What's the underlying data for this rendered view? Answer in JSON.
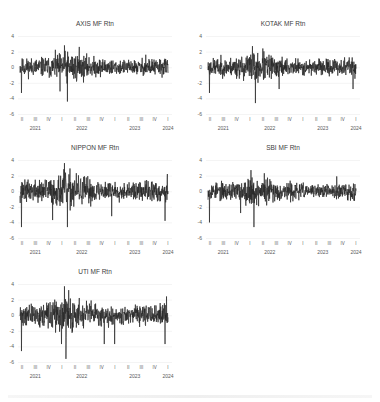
{
  "figure": {
    "panels": [
      {
        "id": "axis",
        "title": "AXIS MF Rtn",
        "left": 0,
        "top": 20
      },
      {
        "id": "kotak",
        "title": "KOTAK MF Rtn",
        "left": 188,
        "top": 20
      },
      {
        "id": "nippon",
        "title": "NIPPON MF Rtn",
        "left": 0,
        "top": 144
      },
      {
        "id": "sbi",
        "title": "SBI MF Rtn",
        "left": 188,
        "top": 144
      },
      {
        "id": "uti",
        "title": "UTI MF Rtn",
        "left": 0,
        "top": 268
      }
    ],
    "y_ticks": [
      "4",
      "2",
      "0",
      "-2",
      "-4",
      "-6"
    ],
    "quarter_ticks": [
      "II",
      "III",
      "IV",
      "I",
      "II",
      "III",
      "IV",
      "I",
      "II",
      "III",
      "IV",
      "I"
    ],
    "year_ticks": [
      {
        "label": "2021",
        "q": 1
      },
      {
        "label": "2022",
        "q": 4.5
      },
      {
        "label": "2023",
        "q": 8.5
      },
      {
        "label": "2024",
        "q": 11
      }
    ],
    "line_color": "#262626",
    "grid_color": "#ececec"
  },
  "chart_data": [
    {
      "type": "line",
      "title": "AXIS MF Rtn",
      "xlabel": "",
      "ylabel": "",
      "ylim": [
        -6,
        4
      ],
      "x_range": [
        "2021-Q2",
        "2024-Q1"
      ],
      "grid": true,
      "series": [
        {
          "name": "AXIS MF Rtn",
          "seed": 11,
          "volatility": 0.8,
          "spikes": [
            {
              "pos": 0.01,
              "value": -3.3
            },
            {
              "pos": 0.3,
              "value": 2.8
            },
            {
              "pos": 0.32,
              "value": -4.4
            },
            {
              "pos": 0.27,
              "value": -3.1
            },
            {
              "pos": 0.4,
              "value": 2.6
            },
            {
              "pos": 0.85,
              "value": 1.6
            }
          ]
        }
      ]
    },
    {
      "type": "line",
      "title": "KOTAK MF Rtn",
      "xlabel": "",
      "ylabel": "",
      "ylim": [
        -6,
        4
      ],
      "x_range": [
        "2021-Q2",
        "2024-Q1"
      ],
      "grid": true,
      "series": [
        {
          "name": "KOTAK MF Rtn",
          "seed": 23,
          "volatility": 0.8,
          "spikes": [
            {
              "pos": 0.01,
              "value": -3.3
            },
            {
              "pos": 0.3,
              "value": 2.7
            },
            {
              "pos": 0.32,
              "value": -4.6
            },
            {
              "pos": 0.37,
              "value": 2.4
            },
            {
              "pos": 0.48,
              "value": -2.8
            },
            {
              "pos": 0.98,
              "value": -2.8
            }
          ]
        }
      ]
    },
    {
      "type": "line",
      "title": "NIPPON MF Rtn",
      "xlabel": "",
      "ylabel": "",
      "ylim": [
        -6,
        4
      ],
      "x_range": [
        "2021-Q2",
        "2024-Q1"
      ],
      "grid": true,
      "series": [
        {
          "name": "NIPPON MF Rtn",
          "seed": 37,
          "volatility": 0.95,
          "spikes": [
            {
              "pos": 0.01,
              "value": -4.6
            },
            {
              "pos": 0.22,
              "value": -3.7
            },
            {
              "pos": 0.3,
              "value": 3.6
            },
            {
              "pos": 0.32,
              "value": -4.6
            },
            {
              "pos": 0.62,
              "value": -3.2
            },
            {
              "pos": 0.98,
              "value": -3.8
            },
            {
              "pos": 0.995,
              "value": 2.2
            }
          ]
        }
      ]
    },
    {
      "type": "line",
      "title": "SBI MF Rtn",
      "xlabel": "",
      "ylabel": "",
      "ylim": [
        -6,
        4
      ],
      "x_range": [
        "2021-Q2",
        "2024-Q1"
      ],
      "grid": true,
      "series": [
        {
          "name": "SBI MF Rtn",
          "seed": 53,
          "volatility": 0.75,
          "spikes": [
            {
              "pos": 0.01,
              "value": -4.0
            },
            {
              "pos": 0.29,
              "value": 2.7
            },
            {
              "pos": 0.31,
              "value": -4.6
            },
            {
              "pos": 0.38,
              "value": 2.3
            },
            {
              "pos": 0.22,
              "value": -2.8
            },
            {
              "pos": 0.87,
              "value": 1.9
            }
          ]
        }
      ]
    },
    {
      "type": "line",
      "title": "UTI MF Rtn",
      "xlabel": "",
      "ylabel": "",
      "ylim": [
        -6,
        4
      ],
      "x_range": [
        "2021-Q2",
        "2024-Q1"
      ],
      "grid": true,
      "series": [
        {
          "name": "UTI MF Rtn",
          "seed": 71,
          "volatility": 0.95,
          "spikes": [
            {
              "pos": 0.01,
              "value": -4.6
            },
            {
              "pos": 0.3,
              "value": 3.7
            },
            {
              "pos": 0.31,
              "value": -5.6
            },
            {
              "pos": 0.28,
              "value": -3.7
            },
            {
              "pos": 0.57,
              "value": -3.7
            },
            {
              "pos": 0.64,
              "value": -3.7
            },
            {
              "pos": 0.98,
              "value": -3.7
            },
            {
              "pos": 0.99,
              "value": 2.4
            }
          ]
        }
      ]
    }
  ]
}
